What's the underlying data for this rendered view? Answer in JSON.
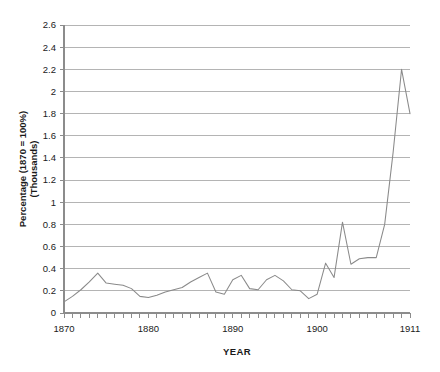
{
  "chart_data": {
    "type": "line",
    "title": "",
    "xlabel": "YEAR",
    "ylabel": "Percentage (1870 = 100%)",
    "ylabel_line2": "(Thousands)",
    "xlim": [
      1870,
      1911
    ],
    "ylim": [
      0,
      2.6
    ],
    "grid": true,
    "legend": false,
    "legend_position": "none",
    "ytick_labels": [
      "0",
      "0.2",
      "0.4",
      "0.6",
      "0.8",
      "1",
      "1.2",
      "1.4",
      "1.6",
      "1.8",
      "2",
      "2.2",
      "2.4",
      "2.6"
    ],
    "ytick_values": [
      0,
      0.2,
      0.4,
      0.6,
      0.8,
      1.0,
      1.2,
      1.4,
      1.6,
      1.8,
      2.0,
      2.2,
      2.4,
      2.6
    ],
    "xtick_labels": [
      "1870",
      "1880",
      "1890",
      "1900",
      "1911"
    ],
    "xtick_values": [
      1870,
      1880,
      1890,
      1900,
      1911
    ],
    "x": [
      1870,
      1871,
      1872,
      1873,
      1874,
      1875,
      1876,
      1877,
      1878,
      1879,
      1880,
      1881,
      1882,
      1883,
      1884,
      1885,
      1886,
      1887,
      1888,
      1889,
      1890,
      1891,
      1892,
      1893,
      1894,
      1895,
      1896,
      1897,
      1898,
      1899,
      1900,
      1901,
      1902,
      1903,
      1904,
      1905,
      1906,
      1907,
      1908,
      1909,
      1910,
      1911
    ],
    "values": [
      0.1,
      0.15,
      0.21,
      0.28,
      0.36,
      0.27,
      0.26,
      0.25,
      0.22,
      0.15,
      0.14,
      0.16,
      0.19,
      0.21,
      0.23,
      0.28,
      0.32,
      0.36,
      0.19,
      0.17,
      0.3,
      0.34,
      0.22,
      0.21,
      0.3,
      0.34,
      0.29,
      0.21,
      0.2,
      0.13,
      0.17,
      0.45,
      0.32,
      0.82,
      0.44,
      0.49,
      0.5,
      0.5,
      0.8,
      1.45,
      2.2,
      1.8
    ],
    "series_color": "#8a8a8a",
    "grid_color": "#b4b4b4",
    "axis_color": "#8c8c8c",
    "background_color": "#ffffff"
  }
}
